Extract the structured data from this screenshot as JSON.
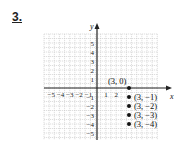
{
  "problem": {
    "number": "3."
  },
  "chart_data": {
    "type": "scatter",
    "title": "",
    "xlabel": "x",
    "ylabel": "y",
    "xlim": [
      -5,
      6
    ],
    "ylim": [
      -5,
      6
    ],
    "grid": true,
    "x_ticks": [
      "-5",
      "-4",
      "-3",
      "-2",
      "-1",
      "1",
      "2"
    ],
    "y_ticks": [
      "5",
      "4",
      "3",
      "2",
      "1",
      "-1",
      "-2",
      "-3",
      "-4",
      "-5"
    ],
    "points": [
      {
        "x": 3,
        "y": 0,
        "label": "(3, 0)"
      },
      {
        "x": 3,
        "y": -1,
        "label": "(3, −1)"
      },
      {
        "x": 3,
        "y": -2,
        "label": "(3, −2)"
      },
      {
        "x": 3,
        "y": -3,
        "label": "(3, −3)"
      },
      {
        "x": 3,
        "y": -4,
        "label": "(3, −4)"
      }
    ]
  }
}
